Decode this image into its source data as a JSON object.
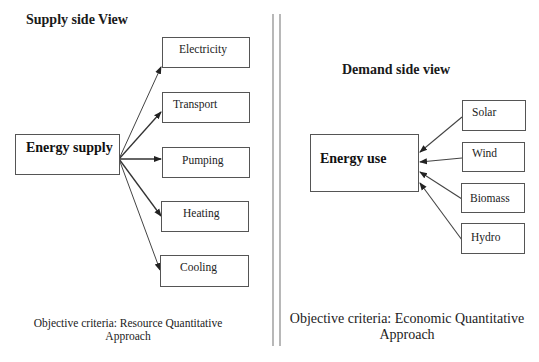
{
  "supply": {
    "title": "Supply side View",
    "source": "Energy supply",
    "targets": [
      "Electricity",
      "Transport",
      "Pumping",
      "Heating",
      "Cooling"
    ],
    "caption_line1": "Objective criteria: Resource Quantitative",
    "caption_line2": "Approach"
  },
  "demand": {
    "title": "Demand side view",
    "target": "Energy use",
    "sources": [
      "Solar",
      "Wind",
      "Biomass",
      "Hydro"
    ],
    "caption_line1": "Objective criteria: Economic Quantitative",
    "caption_line2": "Approach"
  },
  "colors": {
    "line": "#333333",
    "box_border": "#555555",
    "divider": "#888888"
  }
}
